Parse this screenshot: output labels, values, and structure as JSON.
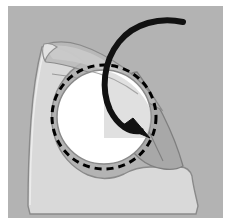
{
  "figure": {
    "title": "Surgical flap rotation diagram",
    "width": 231,
    "height": 224
  },
  "colors": {
    "page_background": "#ffffff",
    "field_background": "#b3b3b3",
    "tissue_light": "#d9d9d9",
    "flap_mid": "#a8a8a8",
    "flap_shadow": "#9a9a9a",
    "defect_white": "#ffffff",
    "outline_gray": "#8a8a8a",
    "outline_soft": "#bdbdbd",
    "ink_black": "#111111",
    "dashed_line": "#000000"
  },
  "elements": {
    "background_panel": "background-panel",
    "tissue_body": "tissue-body",
    "flap_upper": "flap-upper-leaf",
    "flap_right": "flap-right-leaf",
    "defect_circle": "circular-defect",
    "dashed_incision": "dashed-incision-line",
    "rotation_arrow": "rotation-arrow",
    "arrow_head": "rotation-arrow-head",
    "fold_crease": "fold-crease-line"
  },
  "geometry": {
    "defect_center_x": 104,
    "defect_center_y": 117,
    "defect_radius": 47,
    "dashed_radius": 52,
    "dash_pattern": "7 5",
    "arrow_tail_x": 183,
    "arrow_tail_y": 22,
    "arrow_tip_x": 146,
    "arrow_tip_y": 135
  },
  "labels": {
    "caption": "",
    "annotations": []
  }
}
